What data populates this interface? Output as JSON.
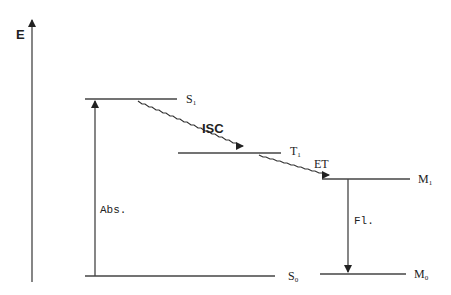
{
  "diagram": {
    "type": "energy-level diagram (Jablonski)",
    "axis_label": "E",
    "levels": [
      {
        "id": "S1",
        "label": "S",
        "sub": "1"
      },
      {
        "id": "T1",
        "label": "T",
        "sub": "1"
      },
      {
        "id": "M1",
        "label": "M",
        "sub": "1"
      },
      {
        "id": "S0",
        "label": "S",
        "sub": "0"
      },
      {
        "id": "M0",
        "label": "M",
        "sub": "0"
      }
    ],
    "transitions": [
      {
        "id": "abs",
        "label": "Abs.",
        "from": "S0",
        "to": "S1",
        "style": "straight-arrow-up"
      },
      {
        "id": "isc",
        "label": "ISC",
        "from": "S1",
        "to": "T1",
        "style": "wavy-arrow"
      },
      {
        "id": "et",
        "label": "ET",
        "from": "T1",
        "to": "M1",
        "style": "wavy-arrow"
      },
      {
        "id": "fl",
        "label": "Fl.",
        "from": "M1",
        "to": "M0",
        "style": "straight-arrow-down"
      }
    ],
    "line_color": "#333333"
  }
}
